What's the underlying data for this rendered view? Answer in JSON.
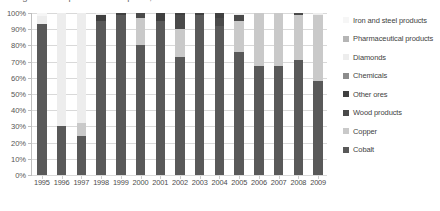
{
  "title": "Figure: Composition of exports, shares of total",
  "chart_data": {
    "type": "bar",
    "subtype": "stacked-100-percent-column",
    "title": "",
    "xlabel": "",
    "ylabel": "",
    "ylim": [
      0,
      100
    ],
    "grid": true,
    "legend_position": "right",
    "categories": [
      "1995",
      "1996",
      "1997",
      "1998",
      "1999",
      "2000",
      "2001",
      "2002",
      "2003",
      "2004",
      "2005",
      "2006",
      "2007",
      "2008",
      "2009"
    ],
    "y_tick_labels": [
      "0%",
      "10%",
      "20%",
      "30%",
      "40%",
      "50%",
      "60%",
      "70%",
      "80%",
      "90%",
      "100%"
    ],
    "y_tick_values": [
      0,
      10,
      20,
      30,
      40,
      50,
      60,
      70,
      80,
      90,
      100
    ],
    "series": [
      {
        "name": "Cobalt",
        "color": "#595959",
        "values": [
          93,
          30,
          24,
          95,
          99,
          80,
          95,
          73,
          99,
          92,
          76,
          67,
          67,
          71,
          58
        ]
      },
      {
        "name": "Copper",
        "color": "#c9c9c9",
        "values": [
          0,
          0,
          8,
          0,
          0,
          17,
          0,
          17,
          0,
          0,
          19,
          33,
          33,
          28,
          41
        ]
      },
      {
        "name": "Wood products",
        "color": "#4a4a4a",
        "values": [
          0,
          0,
          0,
          0,
          0,
          3,
          0,
          9,
          0,
          5,
          4,
          0,
          0,
          1,
          0
        ]
      },
      {
        "name": "Other ores",
        "color": "#404040",
        "values": [
          0,
          0,
          0,
          4,
          1,
          0,
          5,
          1,
          1,
          3,
          0,
          0,
          0,
          0,
          0
        ]
      },
      {
        "name": "Chemicals",
        "color": "#8c8c8c",
        "values": [
          0,
          0,
          0,
          0,
          0,
          0,
          0,
          0,
          0,
          0,
          0,
          0,
          0,
          0,
          0
        ]
      },
      {
        "name": "Diamonds",
        "color": "#ededed",
        "values": [
          5,
          70,
          68,
          1,
          0,
          0,
          0,
          0,
          0,
          0,
          1,
          0,
          0,
          0,
          1
        ]
      },
      {
        "name": "Pharmaceutical products",
        "color": "#b5b5b5",
        "values": [
          0,
          0,
          0,
          0,
          0,
          0,
          0,
          0,
          0,
          0,
          0,
          0,
          0,
          0,
          0
        ]
      },
      {
        "name": "Iron and steel products",
        "color": "#f6f6f6",
        "values": [
          2,
          0,
          0,
          0,
          0,
          0,
          0,
          0,
          0,
          0,
          0,
          0,
          0,
          0,
          0
        ]
      }
    ]
  },
  "legend": {
    "items": [
      {
        "label": "Iron and steel products",
        "color": "#f6f6f6"
      },
      {
        "label": "Pharmaceutical products",
        "color": "#b5b5b5"
      },
      {
        "label": "Diamonds",
        "color": "#ededed"
      },
      {
        "label": "Chemicals",
        "color": "#8c8c8c"
      },
      {
        "label": "Other ores",
        "color": "#404040"
      },
      {
        "label": "Wood products",
        "color": "#4a4a4a"
      },
      {
        "label": "Copper",
        "color": "#c9c9c9"
      },
      {
        "label": "Cobalt",
        "color": "#595959"
      }
    ]
  }
}
